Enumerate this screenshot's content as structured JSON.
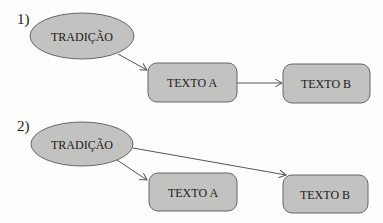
{
  "diagrams": [
    {
      "number": "1)",
      "source": "TRADIÇÃO",
      "box_a": "TEXTO A",
      "box_b": "TEXTO B"
    },
    {
      "number": "2)",
      "source": "TRADIÇÃO",
      "box_a": "TEXTO A",
      "box_b": "TEXTO B"
    }
  ],
  "colors": {
    "shape_fill": "#c2c2c0",
    "stroke": "#555555",
    "background": "#fdfdfb"
  }
}
